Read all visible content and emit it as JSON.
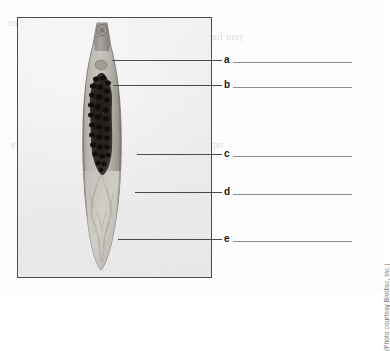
{
  "figure": {
    "caption_credit": "(Photo courtesy Biodisc, Inc.)",
    "specimen_alt": "stained-fluke-specimen-photomicrograph"
  },
  "labels": [
    {
      "letter": "a",
      "answer": ""
    },
    {
      "letter": "b",
      "answer": ""
    },
    {
      "letter": "c",
      "answer": ""
    },
    {
      "letter": "d",
      "answer": ""
    },
    {
      "letter": "e",
      "answer": ""
    }
  ],
  "showthrough": {
    "line1": "The most simple figure (figure) of are then",
    "line2": "your function line in be fitted to one of the offset and the",
    "line3": "the parts is our fit",
    "line4": "represent the letter of the correct answer on the space",
    "line5": "provided before the question"
  }
}
